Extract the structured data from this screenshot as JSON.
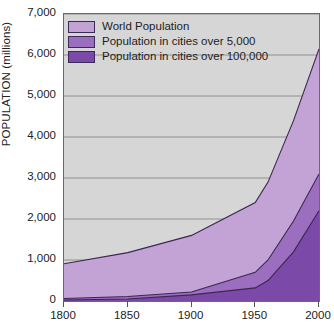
{
  "chart_data": {
    "type": "area",
    "title": "",
    "subtitle": "",
    "xlabel": "",
    "ylabel": "POPULATION  (millions)",
    "xlim": [
      1800,
      2000
    ],
    "ylim": [
      0,
      7000
    ],
    "grid": true,
    "stacked": false,
    "legend_position": "top-left",
    "x_ticks": [
      "1800",
      "1850",
      "1900",
      "1950",
      "2000"
    ],
    "x_tick_values": [
      1800,
      1850,
      1900,
      1950,
      2000
    ],
    "y_ticks": [
      "0",
      "1,000",
      "2,000",
      "3,000",
      "4,000",
      "5,000",
      "6,000",
      "7,000"
    ],
    "y_tick_values": [
      0,
      1000,
      2000,
      3000,
      4000,
      5000,
      6000,
      7000
    ],
    "x": [
      1800,
      1850,
      1900,
      1950,
      1960,
      1980,
      2000
    ],
    "series": [
      {
        "name": "World Population",
        "color": "#c3a2d6",
        "values": [
          910,
          1180,
          1600,
          2400,
          2900,
          4400,
          6150
        ]
      },
      {
        "name": "Population in cities over 5,000",
        "color": "#9c6ec0",
        "values": [
          60,
          110,
          220,
          700,
          1000,
          1950,
          3100
        ]
      },
      {
        "name": "Population in cities over 100,000",
        "color": "#7b4aa8",
        "values": [
          25,
          50,
          150,
          320,
          500,
          1200,
          2200
        ]
      }
    ]
  },
  "legend": {
    "items": [
      {
        "label": "World Population",
        "color": "#c3a2d6"
      },
      {
        "label": "Population in cities over 5,000",
        "color": "#9c6ec0"
      },
      {
        "label": "Population in cities over 100,000",
        "color": "#7b4aa8"
      }
    ]
  },
  "axes": {
    "y_title": "POPULATION  (millions)"
  },
  "colors": {
    "plot_background": "#d6d6d6",
    "gridline": "#8a8a8a",
    "axis_line": "#6a6a6a",
    "series_outline": "#3b2750",
    "light_purple": "#c3a2d6",
    "mid_purple": "#9c6ec0",
    "dark_purple": "#7b4aa8"
  }
}
